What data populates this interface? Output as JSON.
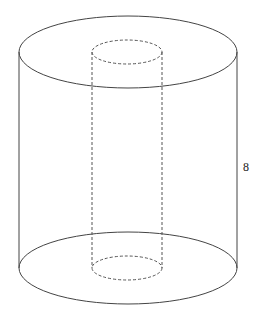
{
  "diagram": {
    "type": "hollow-cylinder",
    "height_label": "8",
    "stroke_color": "#444444",
    "outer": {
      "cx": 128,
      "top_cy": 52,
      "bottom_cy": 268,
      "rx": 109,
      "ry": 36
    },
    "inner": {
      "cx": 127,
      "top_cy": 52,
      "bottom_cy": 268,
      "rx": 35,
      "ry": 12
    }
  }
}
